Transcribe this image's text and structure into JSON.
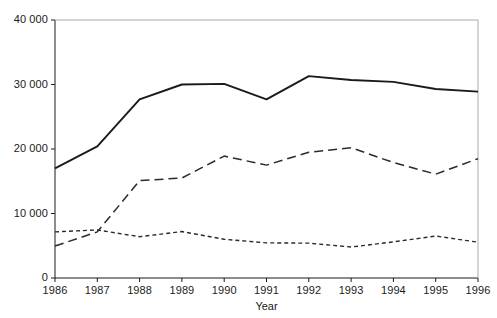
{
  "chart_data": {
    "type": "line",
    "title": "",
    "subtitle": "",
    "xlabel": "Year",
    "ylabel": "",
    "x": [
      1986,
      1987,
      1988,
      1989,
      1990,
      1991,
      1992,
      1993,
      1994,
      1995,
      1996
    ],
    "xtick_labels": [
      "1986",
      "1987",
      "1988",
      "1989",
      "1990",
      "1991",
      "1992",
      "1993",
      "1994",
      "1995",
      "1996"
    ],
    "ytick_labels": [
      "0",
      "10 000",
      "20 000",
      "30 000",
      "40 000"
    ],
    "ytick_values": [
      0,
      10000,
      20000,
      30000,
      40000
    ],
    "xlim": [
      1986,
      1996
    ],
    "ylim": [
      0,
      40000
    ],
    "grid": false,
    "legend": "none",
    "series": [
      {
        "name": "solid-series",
        "style": "solid",
        "color": "#1a1a1a",
        "values": [
          17000,
          20400,
          27700,
          30000,
          30100,
          27700,
          31300,
          30700,
          30400,
          29300,
          28900
        ]
      },
      {
        "name": "long-dashed-series",
        "style": "long-dashed",
        "color": "#2b2b2b",
        "values": [
          4950,
          7150,
          15100,
          15500,
          18900,
          17500,
          19500,
          20200,
          17900,
          16100,
          18500
        ]
      },
      {
        "name": "short-dashed-series",
        "style": "short-dashed",
        "color": "#2b2b2b",
        "values": [
          7150,
          7450,
          6400,
          7200,
          6000,
          5450,
          5400,
          4800,
          5600,
          6500,
          5550
        ]
      }
    ]
  },
  "axes": {
    "x_title": "Year"
  }
}
